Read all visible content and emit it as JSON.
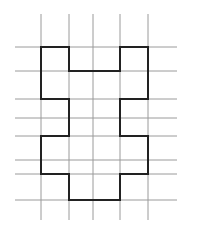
{
  "diagram": {
    "background": "#ffffff",
    "grid_color": "#9a9a9a",
    "outline_color": "#222222",
    "grid": {
      "vertical_x": [
        41,
        69,
        93,
        120,
        148
      ],
      "vertical_y_range": [
        14,
        220
      ],
      "horizontal_y": [
        47,
        71,
        99,
        118,
        136,
        160,
        174,
        200
      ],
      "horizontal_x_range": [
        15,
        177
      ]
    },
    "shape": {
      "description": "symmetric closed polygon outline drawn on grid",
      "points": [
        [
          41,
          47
        ],
        [
          69,
          47
        ],
        [
          69,
          71
        ],
        [
          120,
          71
        ],
        [
          120,
          47
        ],
        [
          148,
          47
        ],
        [
          148,
          99
        ],
        [
          120,
          99
        ],
        [
          120,
          136
        ],
        [
          148,
          136
        ],
        [
          148,
          174
        ],
        [
          120,
          174
        ],
        [
          120,
          200
        ],
        [
          69,
          200
        ],
        [
          69,
          174
        ],
        [
          41,
          174
        ],
        [
          41,
          136
        ],
        [
          69,
          136
        ],
        [
          69,
          99
        ],
        [
          41,
          99
        ]
      ]
    }
  }
}
